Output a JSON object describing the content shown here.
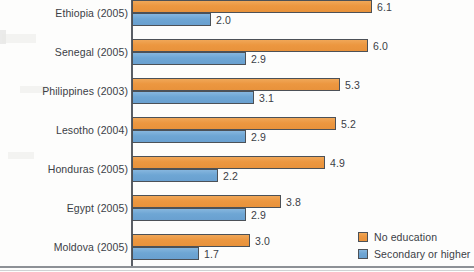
{
  "chart_data": {
    "type": "bar",
    "orientation": "horizontal",
    "grouped": true,
    "title": "",
    "subtitle": "",
    "xlabel": "",
    "ylabel": "",
    "grid": false,
    "xlim": [
      0,
      6.5
    ],
    "axis_visible": [
      "y"
    ],
    "categories": [
      "Ethiopia (2005)",
      "Senegal (2005)",
      "Philippines (2003)",
      "Lesotho (2004)",
      "Honduras (2005)",
      "Egypt (2005)",
      "Moldova (2005)"
    ],
    "series": [
      {
        "name": "No education",
        "color": "#ec9740",
        "values": [
          6.1,
          6.0,
          5.3,
          5.2,
          4.9,
          3.8,
          3.0
        ],
        "value_labels": [
          "6.1",
          "6.0",
          "5.3",
          "5.2",
          "4.9",
          "3.8",
          "3.0"
        ]
      },
      {
        "name": "Secondary or higher",
        "color": "#6ea6d4",
        "values": [
          2.0,
          2.9,
          3.1,
          2.9,
          2.2,
          2.9,
          1.7
        ],
        "value_labels": [
          "2.0",
          "2.9",
          "3.1",
          "2.9",
          "2.2",
          "2.9",
          "1.7"
        ]
      }
    ],
    "legend": {
      "position": "bottom-right",
      "entries": [
        {
          "label": "No education",
          "color": "#ec9740",
          "swatch": "orange-swatch"
        },
        {
          "label": "Secondary or higher",
          "color": "#6ea6d4",
          "swatch": "blue-swatch"
        }
      ]
    },
    "colors": {
      "no_education": "#ec9740",
      "secondary_or_higher": "#6ea6d4",
      "bar_outline": "#4c5157",
      "axis": "#5a5f66",
      "text": "#3b4046",
      "background": "#fdfdfc"
    },
    "scale": {
      "px_per_unit": 39.3,
      "origin_x": 132
    },
    "layout": {
      "group_pitch": 39,
      "bar_height": 13,
      "first_group_top": 0,
      "label_right_edge": 128
    }
  }
}
